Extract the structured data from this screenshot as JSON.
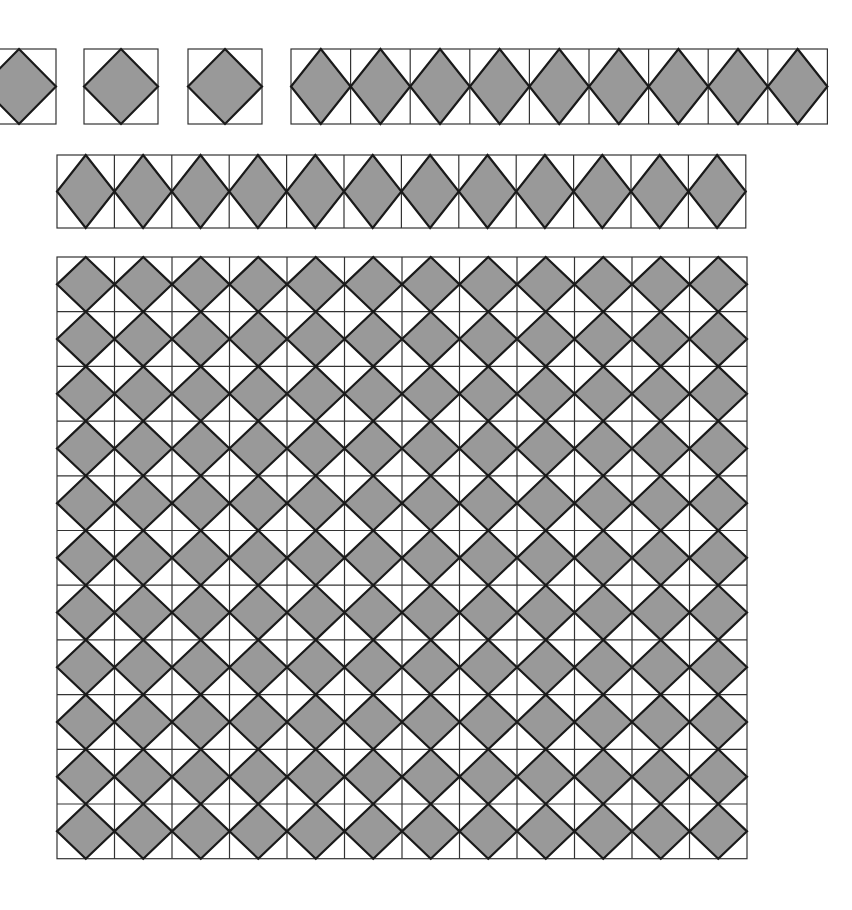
{
  "figure": {
    "background_color": "#ffffff",
    "diamond_fill_color": "#999999",
    "diamond_stroke_color": "#1a1a1a",
    "cell_stroke_color": "#333333",
    "cell_stroke_width": 1.2,
    "diamond_stroke_width": 2.2
  },
  "chart_data": {
    "type": "diagram",
    "xlabel": "",
    "ylabel": "",
    "grid": false,
    "legend": "none",
    "cell_size_px": 59.6,
    "shape_motif": "unit square with inscribed rotated square touching the midpoints of its four edges",
    "groups": [
      {
        "name": "isolated-square-1",
        "kind": "single-cell",
        "rows": 1,
        "cols": 1,
        "x": -18,
        "y": 49,
        "cell_w": 74,
        "cell_h": 75,
        "clipped_left": true,
        "diamond_count": 1
      },
      {
        "name": "isolated-square-2",
        "kind": "single-cell",
        "rows": 1,
        "cols": 1,
        "x": 84,
        "y": 49,
        "cell_w": 74,
        "cell_h": 75,
        "clipped_left": false,
        "diamond_count": 1
      },
      {
        "name": "isolated-square-3",
        "kind": "single-cell",
        "rows": 1,
        "cols": 1,
        "x": 188,
        "y": 49,
        "cell_w": 74,
        "cell_h": 75,
        "clipped_left": false,
        "diamond_count": 1
      },
      {
        "name": "strip-row-top",
        "kind": "horizontal-strip",
        "rows": 1,
        "cols": 9,
        "x": 291,
        "y": 49,
        "cell_w": 59.6,
        "cell_h": 75,
        "clipped_left": false,
        "diamond_count": 9
      },
      {
        "name": "strip-row-second",
        "kind": "horizontal-strip",
        "rows": 1,
        "cols": 12,
        "x": 57,
        "y": 155,
        "cell_w": 57.4,
        "cell_h": 73,
        "clipped_left": false,
        "diamond_count": 12
      },
      {
        "name": "main-grid",
        "kind": "grid",
        "rows": 11,
        "cols": 12,
        "x": 57,
        "y": 257,
        "cell_w": 57.5,
        "cell_h": 54.7,
        "clipped_left": false,
        "diamond_count": 132
      }
    ],
    "totals": {
      "isolated_squares": 3,
      "strip_top_cells": 9,
      "strip_second_cells": 12,
      "main_grid_cells": 132,
      "main_grid_rows": 11,
      "main_grid_cols": 12,
      "total_diamonds": 156
    }
  }
}
